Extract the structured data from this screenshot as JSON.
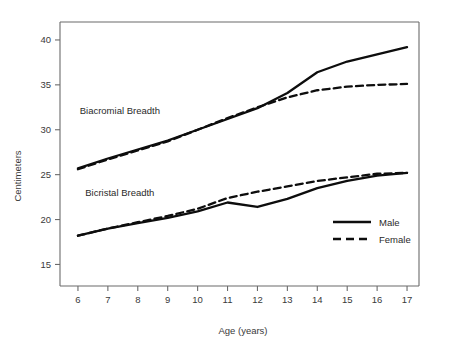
{
  "chart_data": {
    "type": "line",
    "title": "",
    "xlabel": "Age (years)",
    "ylabel": "Centimeters",
    "xlim": [
      5.4,
      17.4
    ],
    "ylim": [
      12.6,
      42.0
    ],
    "xticks": [
      6,
      7,
      8,
      9,
      10,
      11,
      12,
      13,
      14,
      15,
      16,
      17
    ],
    "yticks": [
      15,
      20,
      25,
      30,
      35,
      40
    ],
    "grid": false,
    "legend_position": "lower-right",
    "x": [
      6,
      7,
      8,
      9,
      10,
      11,
      12,
      13,
      14,
      15,
      16,
      17
    ],
    "annotations": [
      {
        "text": "Biacromial Breadth",
        "x": 7.4,
        "y": 31.8
      },
      {
        "text": "Bicristal Breadth",
        "x": 7.4,
        "y": 22.6
      }
    ],
    "groups": [
      {
        "name": "Biacromial Breadth",
        "series": [
          {
            "name": "Male",
            "style": "solid",
            "values": [
              25.7,
              26.8,
              27.8,
              28.8,
              30.0,
              31.2,
              32.4,
              34.1,
              36.4,
              37.6,
              38.4,
              39.2
            ]
          },
          {
            "name": "Female",
            "style": "dashed",
            "values": [
              25.6,
              26.7,
              27.7,
              28.7,
              30.0,
              31.3,
              32.5,
              33.6,
              34.4,
              34.8,
              35.0,
              35.1
            ]
          }
        ]
      },
      {
        "name": "Bicristal Breadth",
        "series": [
          {
            "name": "Male",
            "style": "solid",
            "values": [
              18.2,
              19.0,
              19.6,
              20.2,
              20.9,
              21.9,
              21.4,
              22.3,
              23.5,
              24.3,
              24.9,
              25.2
            ]
          },
          {
            "name": "Female",
            "style": "dashed",
            "values": [
              18.2,
              19.0,
              19.7,
              20.4,
              21.2,
              22.4,
              23.1,
              23.7,
              24.3,
              24.7,
              25.1,
              25.2
            ]
          }
        ]
      }
    ],
    "legend": [
      {
        "label": "Male",
        "style": "solid"
      },
      {
        "label": "Female",
        "style": "dashed"
      }
    ],
    "colors": {
      "line": "#0d0d0d",
      "axis": "#6b6b6b",
      "text": "#2a2a2a"
    }
  }
}
